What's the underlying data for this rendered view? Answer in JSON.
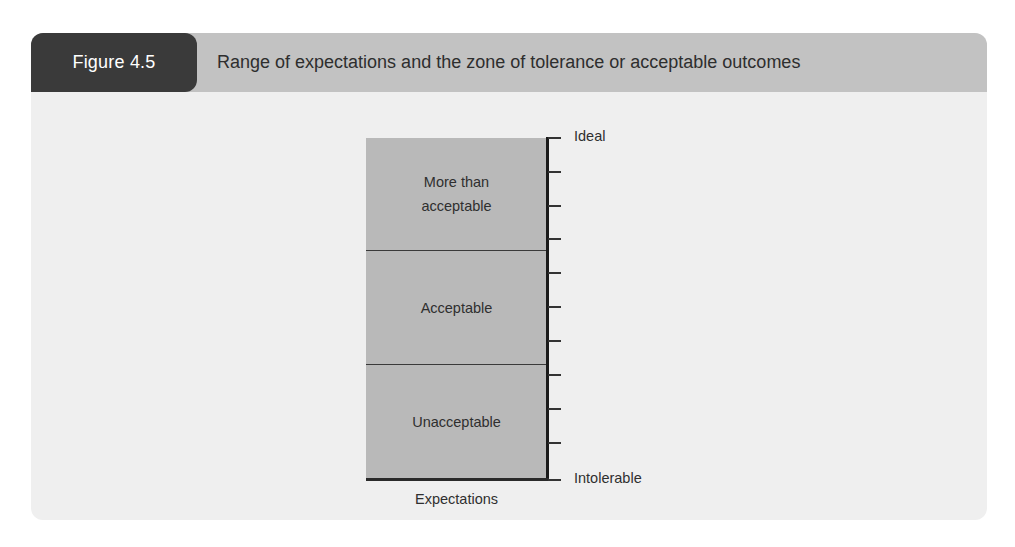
{
  "figure": {
    "label": "Figure 4.5",
    "title": "Range of expectations and the zone of tolerance or acceptable outcomes"
  },
  "diagram": {
    "zones": [
      {
        "line1": "More than",
        "line2": "acceptable"
      },
      {
        "line1": "Acceptable"
      },
      {
        "line1": "Unacceptable"
      }
    ],
    "axis": {
      "top_label": "Ideal",
      "bottom_label": "Intolerable",
      "tick_count": 11
    },
    "x_label": "Expectations"
  },
  "colors": {
    "panel_bg": "#efefef",
    "header_bg": "#c2c2c2",
    "label_bg": "#3a3a3a",
    "zone_fill": "#b9b9b9",
    "axis": "#1a1a1a"
  }
}
